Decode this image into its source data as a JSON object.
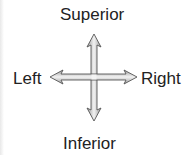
{
  "diagram": {
    "labels": {
      "top": "Superior",
      "bottom": "Inferior",
      "left": "Left",
      "right": "Right"
    },
    "arrow_fill": "#c8c8c8",
    "arrow_stroke": "#555555",
    "text_color": "#222222"
  }
}
